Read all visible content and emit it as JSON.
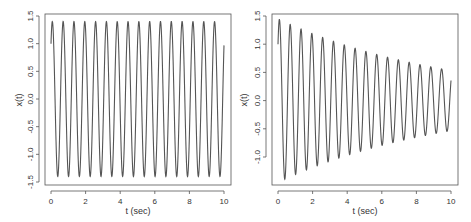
{
  "chart_data": [
    {
      "type": "line",
      "title": "",
      "xlabel": "t (sec)",
      "ylabel": "x(t)",
      "xlim": [
        0,
        10
      ],
      "ylim": [
        -1.5,
        1.5
      ],
      "x_ticks": [
        "0",
        "2",
        "4",
        "6",
        "8",
        "10"
      ],
      "y_ticks": [
        "-1.5",
        "-1.0",
        "-0.5",
        "0.0",
        "0.5",
        "1.0",
        "1.5"
      ],
      "grid": false,
      "legend": null,
      "description": "Undamped oscillation: x(0)=1.0, constant amplitude ~1.4, ~16 cycles over 10 s, ends near 0.35",
      "model": {
        "x0": 1.0,
        "amplitude": 1.4,
        "omega": 10.05,
        "damping": 0.0
      },
      "series": [
        {
          "name": "x(t)",
          "color": "#555555",
          "x": [
            0,
            0.1,
            0.42,
            0.73,
            1.04,
            1.36,
            1.67,
            1.98,
            2.29,
            2.61,
            5.0,
            7.5,
            9.8,
            10.0
          ],
          "values": [
            1.0,
            1.38,
            -1.4,
            1.4,
            -1.4,
            1.4,
            -1.4,
            1.4,
            -1.4,
            1.4,
            0.0,
            0.0,
            1.4,
            0.35
          ]
        }
      ]
    },
    {
      "type": "line",
      "title": "",
      "xlabel": "t (sec)",
      "ylabel": "x(t)",
      "xlim": [
        0,
        10
      ],
      "ylim": [
        -1.45,
        1.5
      ],
      "x_ticks": [
        "0",
        "2",
        "4",
        "6",
        "8",
        "10"
      ],
      "y_ticks": [
        "-1.0",
        "-0.5",
        "0.0",
        "0.5",
        "1.0",
        "1.5"
      ],
      "grid": false,
      "legend": null,
      "description": "Damped oscillation: x(0)=1.0, first peak ~1.4, amplitude decays to ~0.55 by t~9.5, ends near 0.12",
      "model": {
        "x0": 1.0,
        "amplitude": 1.45,
        "omega": 10.05,
        "damping": 0.1
      },
      "series": [
        {
          "name": "x(t)",
          "color": "#555555",
          "x": [
            0,
            0.1,
            0.4,
            0.7,
            1.0,
            1.3,
            1.9,
            2.5,
            3.1,
            4.1,
            5.1,
            6.1,
            7.3,
            8.5,
            9.4,
            10.0
          ],
          "values": [
            1.0,
            1.4,
            -1.35,
            1.3,
            -1.27,
            1.22,
            1.15,
            1.08,
            1.02,
            0.9,
            0.83,
            0.74,
            0.65,
            0.6,
            0.55,
            0.12
          ]
        }
      ]
    }
  ],
  "panels": [
    {
      "xlabel": "t (sec)",
      "ylabel": "x(t)",
      "x_ticks": [
        "0",
        "2",
        "4",
        "6",
        "8",
        "10"
      ],
      "y_ticks": [
        "1.5",
        "1.0",
        "0.5",
        "0.0",
        "-0.5",
        "-1.0",
        "-1.5"
      ]
    },
    {
      "xlabel": "t (sec)",
      "ylabel": "x(t)",
      "x_ticks": [
        "0",
        "2",
        "4",
        "6",
        "8",
        "10"
      ],
      "y_ticks": [
        "1.5",
        "1.0",
        "0.5",
        "0.0",
        "-0.5",
        "-1.0"
      ]
    }
  ]
}
